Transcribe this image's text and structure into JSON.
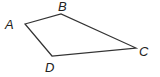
{
  "diagram": {
    "type": "quadrilateral",
    "stroke_color": "#333333",
    "vertices": [
      {
        "name": "A",
        "x": 25,
        "y": 24,
        "label_x": 5,
        "label_y": 29
      },
      {
        "name": "B",
        "x": 61,
        "y": 14,
        "label_x": 58,
        "label_y": 11
      },
      {
        "name": "C",
        "x": 136,
        "y": 48,
        "label_x": 139,
        "label_y": 56
      },
      {
        "name": "D",
        "x": 52,
        "y": 56,
        "label_x": 45,
        "label_y": 72
      }
    ],
    "labels": {
      "A": "A",
      "B": "B",
      "C": "C",
      "D": "D"
    }
  }
}
